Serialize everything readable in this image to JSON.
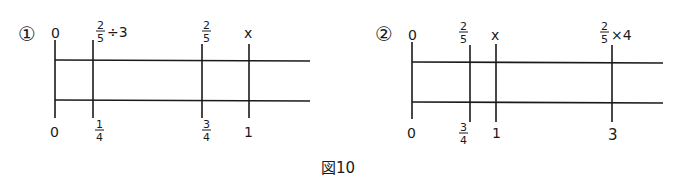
{
  "caption": "図10",
  "diagrams": [
    {
      "label": "①",
      "top_axis": {
        "start": "0",
        "marks": [
          {
            "num": "2",
            "den": "5",
            "suffix": "÷3"
          },
          {
            "num": "2",
            "den": "5",
            "suffix": ""
          },
          {
            "text": "x"
          }
        ]
      },
      "bottom_axis": {
        "start": "0",
        "marks": [
          {
            "num": "1",
            "den": "4"
          },
          {
            "num": "3",
            "den": "4"
          },
          {
            "text": "1"
          }
        ]
      }
    },
    {
      "label": "②",
      "top_axis": {
        "start": "0",
        "marks": [
          {
            "num": "2",
            "den": "5",
            "suffix": ""
          },
          {
            "text": "x"
          },
          {
            "num": "2",
            "den": "5",
            "suffix": "×4"
          }
        ]
      },
      "bottom_axis": {
        "start": "0",
        "marks": [
          {
            "num": "3",
            "den": "4"
          },
          {
            "text": "1"
          },
          {
            "text": "3"
          }
        ]
      }
    }
  ]
}
